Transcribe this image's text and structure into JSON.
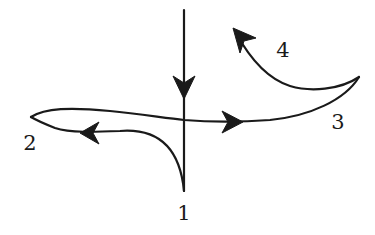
{
  "figure": {
    "stroke_color": "#1a1a1a",
    "background_color": "#ffffff"
  },
  "labels": [
    {
      "id": "1",
      "text": "1",
      "x": 184,
      "y": 213
    },
    {
      "id": "2",
      "text": "2",
      "x": 30,
      "y": 143
    },
    {
      "id": "3",
      "text": "3",
      "x": 338,
      "y": 122
    },
    {
      "id": "4",
      "text": "4",
      "x": 283,
      "y": 50
    }
  ],
  "points": {
    "cusp_1": [
      184,
      191
    ],
    "cusp_2": [
      31,
      117
    ],
    "cusp_3": [
      359,
      77
    ],
    "start_top": [
      184,
      10
    ],
    "end_4_tip": [
      233,
      28
    ]
  },
  "arrows": [
    {
      "id": "down",
      "direction": "down",
      "tip": [
        184,
        99
      ]
    },
    {
      "id": "left",
      "direction": "left",
      "tip": [
        80,
        133
      ]
    },
    {
      "id": "right",
      "direction": "right",
      "tip": [
        243,
        122
      ]
    },
    {
      "id": "up-left",
      "direction": "up-left",
      "tip": [
        233,
        28
      ]
    }
  ]
}
